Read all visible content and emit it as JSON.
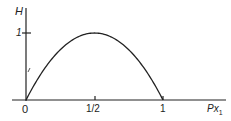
{
  "chart_data": {
    "type": "line",
    "title": "",
    "xlabel": "Px₁",
    "ylabel": "H",
    "x_ticks": [
      "0",
      "1/2",
      "1"
    ],
    "y_ticks": [
      "1"
    ],
    "xlim": [
      0,
      1
    ],
    "ylim": [
      0,
      1
    ],
    "grid": false,
    "legend": null,
    "series": [
      {
        "name": "H",
        "x": [
          0,
          0.1,
          0.2,
          0.3,
          0.4,
          0.5,
          0.6,
          0.7,
          0.8,
          0.9,
          1.0
        ],
        "y": [
          0,
          0.469,
          0.722,
          0.881,
          0.971,
          1.0,
          0.971,
          0.881,
          0.722,
          0.469,
          0
        ]
      }
    ]
  },
  "labels": {
    "y_axis": "H",
    "y_tick_1": "1",
    "x_tick_0": "0",
    "x_tick_half": "1/2",
    "x_tick_1": "1",
    "x_axis": "Px",
    "x_axis_sub": "1"
  }
}
